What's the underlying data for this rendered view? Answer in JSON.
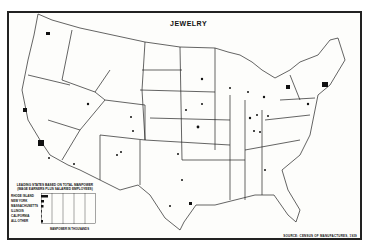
{
  "map": {
    "title": "JEWELRY",
    "source": "SOURCE: CENSUS OF MANUFACTURES, 1939",
    "region": "United States (contiguous)",
    "style": "black-and-white outline map with dot symbols marking jewelry manufacturing locations"
  },
  "legend": {
    "title_line1": "LEADING STATES BASED ON TOTAL MANPOWER",
    "title_line2": "(WAGE EARNERS PLUS SALARIED EMPLOYEES)",
    "axis_label": "MANPOWER IN THOUSANDS",
    "ticks": [
      "0",
      "2",
      "4",
      "6",
      "8",
      "10"
    ],
    "rows": [
      {
        "label": "RHODE ISLAND",
        "value": 10.5
      },
      {
        "label": "NEW YORK",
        "value": 3.5
      },
      {
        "label": "MASSACHUSETTS",
        "value": 2.5
      },
      {
        "label": "ILLINOIS",
        "value": 0.8
      },
      {
        "label": "CALIFORNIA",
        "value": 0.6
      },
      {
        "label": "ALL OTHER",
        "value": 2.0
      }
    ]
  }
}
